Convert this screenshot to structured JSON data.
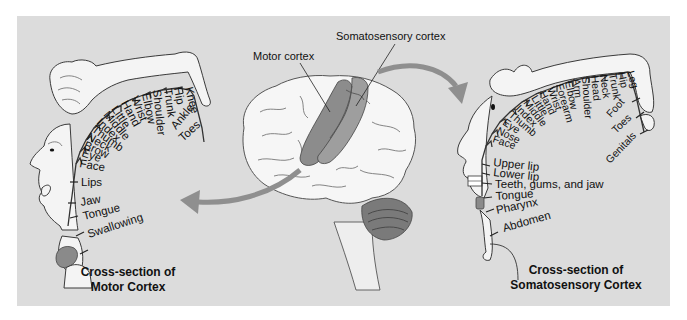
{
  "figure": {
    "background_color": "#dcdcdc",
    "accent_arrow_color": "#8f8f8f",
    "cortex_color": "#8c8c8c"
  },
  "brain": {
    "labels": {
      "motor_cortex": "Motor cortex",
      "somatosensory_cortex": "Somatosensory cortex"
    }
  },
  "motor_section": {
    "title_line1": "Cross-section of",
    "title_line2": "Motor Cortex",
    "arc_labels": [
      "Knee",
      "Hip",
      "Trunk",
      "Shoulder",
      "Elbow",
      "Wrist",
      "Hand",
      "Little",
      "Middle",
      "Index",
      "Thumb",
      "Neck",
      "Brow",
      "Eye",
      "Face"
    ],
    "outer_labels": [
      "Ankle",
      "Toes"
    ],
    "lower_labels": [
      "Lips",
      "Jaw",
      "Tongue",
      "Swallowing"
    ]
  },
  "somatosensory_section": {
    "title_line1": "Cross-section of",
    "title_line2": "Somatosensory Cortex",
    "arc_labels": [
      "Leg",
      "Hip",
      "Trunk",
      "Neck",
      "Head",
      "Shoulder",
      "Arm",
      "Elbow",
      "Forearm",
      "Wrist",
      "Hand",
      "Little",
      "Middle",
      "Index",
      "Thumb",
      "Eye",
      "Nose",
      "Face"
    ],
    "outer_labels": [
      "Foot",
      "Toes",
      "Genitals"
    ],
    "lower_labels": [
      "Upper lip",
      "Lower lip",
      "Teeth, gums, and jaw",
      "Tongue",
      "Pharynx",
      "Abdomen"
    ]
  }
}
